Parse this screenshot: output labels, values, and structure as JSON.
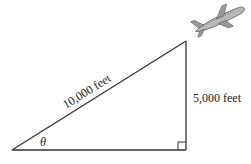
{
  "diagram": {
    "hypotenuse_label": "10,000 feet",
    "vertical_label": "5,000 feet",
    "angle_label": "θ",
    "icons": [
      "airplane-icon",
      "right-angle-marker"
    ],
    "colors": {
      "line": "#333333",
      "plane": "#8a8a8a"
    }
  }
}
